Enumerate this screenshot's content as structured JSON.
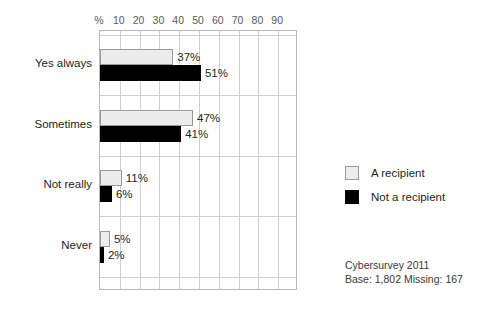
{
  "chart_data": {
    "type": "bar",
    "orientation": "horizontal",
    "title": "",
    "xlabel": "%",
    "ylabel": "",
    "categories": [
      "Yes always",
      "Sometimes",
      "Not really",
      "Never"
    ],
    "series": [
      {
        "name": "A recipient",
        "color": "#ececec",
        "values": [
          37,
          47,
          11,
          5
        ],
        "labels": [
          "37%",
          "47%",
          "11%",
          "5%"
        ]
      },
      {
        "name": "Not a recipient",
        "color": "#000000",
        "values": [
          51,
          41,
          6,
          2
        ],
        "labels": [
          "51%",
          "41%",
          "6%",
          "2%"
        ]
      }
    ],
    "xlim": [
      0,
      100
    ],
    "xticks": [
      0,
      10,
      20,
      30,
      40,
      50,
      60,
      70,
      80,
      90
    ],
    "xtick_labels": [
      "%",
      "10",
      "20",
      "30",
      "40",
      "50",
      "60",
      "70",
      "80",
      "90"
    ],
    "grid": true,
    "legend_position": "right"
  },
  "legend": {
    "items": [
      {
        "label": "A recipient",
        "swatch": "light"
      },
      {
        "label": "Not a recipient",
        "swatch": "dark"
      }
    ]
  },
  "footer": {
    "line1": "Cybersurvey 2011",
    "line2": "Base: 1,802 Missing: 167"
  },
  "colors": {
    "recipient": "#ececec",
    "non_recipient": "#000000",
    "grid": "#cfcfcf",
    "frame": "#b9b9b9",
    "text": "#231f20"
  }
}
